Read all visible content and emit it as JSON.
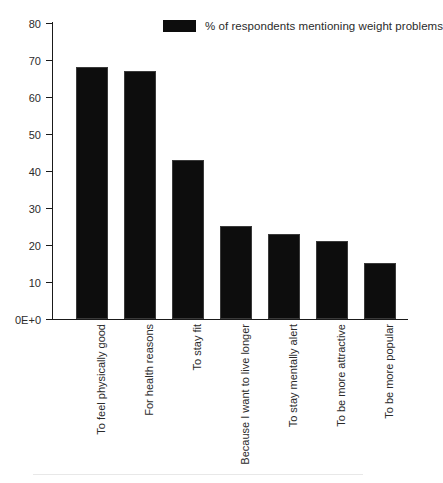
{
  "legend": {
    "swatch_color": "#0d0d0d",
    "label": "% of respondents mentioning weight problems"
  },
  "axis": {
    "y_tick_labels": [
      "80",
      "70",
      "60",
      "50",
      "40",
      "30",
      "20",
      "10",
      "0E+0"
    ],
    "y_tick_values": [
      80,
      70,
      60,
      50,
      40,
      30,
      20,
      10,
      0
    ]
  },
  "chart_data": {
    "type": "bar",
    "title": "",
    "xlabel": "",
    "ylabel": "",
    "ylim": [
      0,
      80
    ],
    "grid": false,
    "legend_position": "top-center",
    "series_name": "% of respondents mentioning weight problems",
    "bar_color": "#0d0d0d",
    "categories": [
      "To feel physically good",
      "For health reasons",
      "To stay fit",
      "Because I want to live longer",
      "To stay mentally alert",
      "To be more attractive",
      "To be more popular"
    ],
    "values": [
      68,
      67,
      43,
      25,
      23,
      21,
      15
    ],
    "ytick_labels": [
      "0E+0",
      "10",
      "20",
      "30",
      "40",
      "50",
      "60",
      "70",
      "80"
    ]
  }
}
